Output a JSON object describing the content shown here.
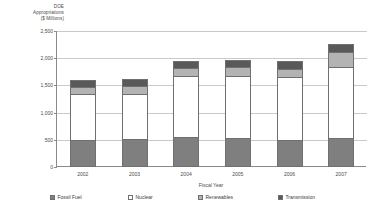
{
  "chart_data": {
    "type": "bar",
    "stacked": true,
    "title": "",
    "subtitle": "",
    "ylabel": "DOE Appropriations ($ Millions)",
    "ylabel_lines": [
      "DOE",
      "Appropriations",
      "($ Millions)"
    ],
    "xlabel": "Fiscal Year",
    "categories": [
      "2002",
      "2003",
      "2004",
      "2005",
      "2006",
      "2007"
    ],
    "ylim": [
      0,
      2500
    ],
    "yticks": [
      0,
      500,
      1000,
      1500,
      2000,
      2500
    ],
    "ytick_labels": [
      "0",
      "500",
      "1,000",
      "1,500",
      "2,000",
      "2,500"
    ],
    "grid": true,
    "legend_position": "bottom",
    "series": [
      {
        "name": "Fossil Fuel",
        "color": "#7f7f7f",
        "values": [
          500,
          510,
          550,
          540,
          500,
          540
        ]
      },
      {
        "name": "Nuclear",
        "color": "#ffffff",
        "values": [
          845,
          830,
          1120,
          1140,
          1155,
          1290
        ]
      },
      {
        "name": "Renewables",
        "color": "#b3b3b3",
        "values": [
          135,
          150,
          155,
          150,
          155,
          290
        ]
      },
      {
        "name": "Transmission",
        "color": "#595959",
        "values": [
          120,
          130,
          120,
          130,
          140,
          140
        ]
      }
    ],
    "totals": [
      1600,
      1620,
      1945,
      1960,
      1950,
      2260
    ]
  },
  "colors": {
    "axis": "#8a8a8a",
    "gridline": "#c9c9c9",
    "bar_outline": "#6f6f6f",
    "text": "#3a3a3a",
    "background": "#ffffff"
  }
}
